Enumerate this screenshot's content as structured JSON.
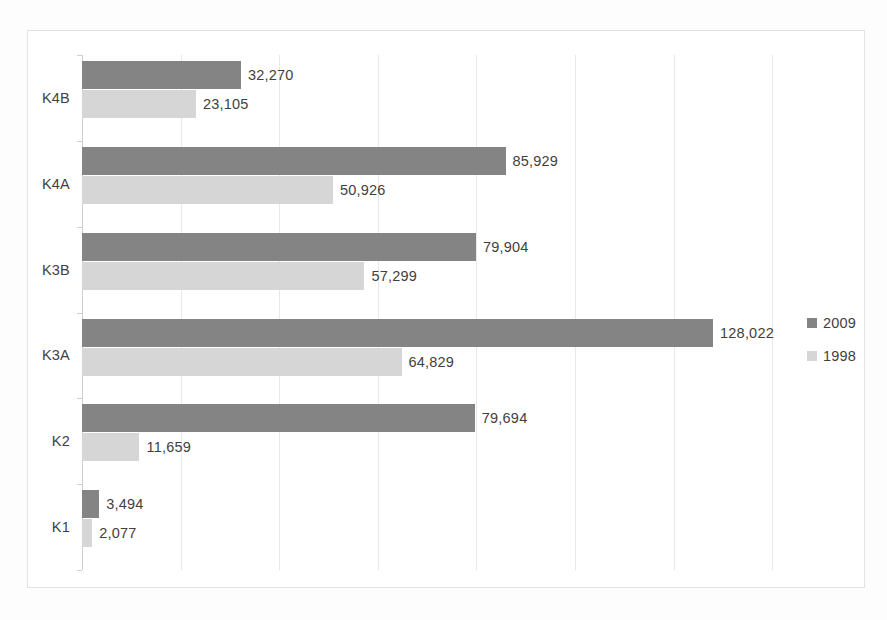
{
  "chart_data": {
    "type": "bar",
    "orientation": "horizontal",
    "title": "",
    "subtitle": "",
    "xlabel": "",
    "ylabel": "",
    "categories": [
      "K1",
      "K2",
      "K3A",
      "K3B",
      "K4A",
      "K4B"
    ],
    "category_order_top_to_bottom": [
      "K4B",
      "K4A",
      "K3B",
      "K3A",
      "K2",
      "K1"
    ],
    "series": [
      {
        "name": "2009",
        "color": "#848484",
        "values": [
          3494,
          79694,
          128022,
          79904,
          85929,
          32270
        ],
        "labels": [
          "3,494",
          "79,694",
          "128,022",
          "79,904",
          "85,929",
          "32,270"
        ]
      },
      {
        "name": "1998",
        "color": "#d6d6d6",
        "values": [
          2077,
          11659,
          64829,
          57299,
          50926,
          23105
        ],
        "labels": [
          "2,077",
          "11,659",
          "64,829",
          "57,299",
          "50,926",
          "23,105"
        ]
      }
    ],
    "xlim": [
      0,
      142000
    ],
    "gridlines": [
      20000,
      40000,
      60000,
      80000,
      100000,
      120000,
      140000
    ],
    "grid": true,
    "tick_labels_visible": false,
    "legend": {
      "position": "right",
      "entries": [
        {
          "label": "2009",
          "color": "#848484"
        },
        {
          "label": "1998",
          "color": "#d6d6d6"
        }
      ]
    },
    "px_per_unit": 0.004929,
    "rows": [
      {
        "category": "K4B",
        "v2009": 32270,
        "l2009": "32,270",
        "v1998": 23105,
        "l1998": "23,105"
      },
      {
        "category": "K4A",
        "v2009": 85929,
        "l2009": "85,929",
        "v1998": 50926,
        "l1998": "50,926"
      },
      {
        "category": "K3B",
        "v2009": 79904,
        "l2009": "79,904",
        "v1998": 57299,
        "l1998": "57,299"
      },
      {
        "category": "K3A",
        "v2009": 128022,
        "l2009": "128,022",
        "v1998": 64829,
        "l1998": "64,829"
      },
      {
        "category": "K2",
        "v2009": 79694,
        "l2009": "79,694",
        "v1998": 11659,
        "l1998": "11,659"
      },
      {
        "category": "K1",
        "v2009": 3494,
        "l2009": "3,494",
        "v1998": 2077,
        "l1998": "2,077"
      }
    ]
  }
}
